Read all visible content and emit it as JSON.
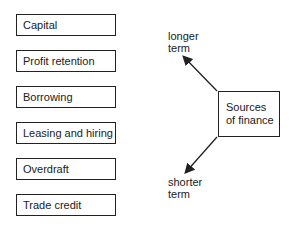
{
  "diagram": {
    "sources": [
      {
        "label": "Capital"
      },
      {
        "label": "Profit retention"
      },
      {
        "label": "Borrowing"
      },
      {
        "label": "Leasing and hiring"
      },
      {
        "label": "Overdraft"
      },
      {
        "label": "Trade credit"
      }
    ],
    "center": {
      "line1": "Sources",
      "line2": "of finance"
    },
    "arrows": {
      "up": {
        "line1": "longer",
        "line2": "term"
      },
      "down": {
        "line1": "shorter",
        "line2": "term"
      }
    }
  }
}
